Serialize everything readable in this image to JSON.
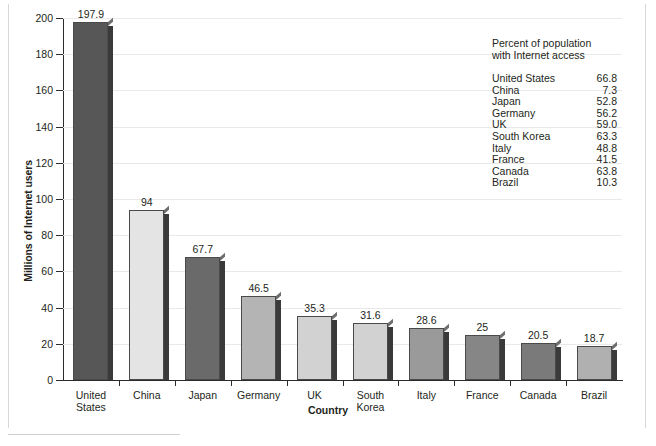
{
  "chart_data": {
    "type": "bar",
    "title": "",
    "xlabel": "Country",
    "ylabel": "Millions of Internet users",
    "ylim": [
      0,
      200
    ],
    "ytick_step": 20,
    "yticks": [
      "200",
      "180",
      "160",
      "140",
      "120",
      "100",
      "80",
      "60",
      "40",
      "20",
      "0"
    ],
    "grid": "horizontal",
    "legend_position": "top-right-inset-table",
    "categories": [
      "United States",
      "China",
      "Japan",
      "Germany",
      "UK",
      "South Korea",
      "Italy",
      "France",
      "Canada",
      "Brazil"
    ],
    "category_lines": [
      [
        "United",
        "States"
      ],
      [
        "China"
      ],
      [
        "Japan"
      ],
      [
        "Germany"
      ],
      [
        "UK"
      ],
      [
        "South",
        "Korea"
      ],
      [
        "Italy"
      ],
      [
        "France"
      ],
      [
        "Canada"
      ],
      [
        "Brazil"
      ]
    ],
    "values": [
      197.9,
      94,
      67.7,
      46.5,
      35.3,
      31.6,
      28.6,
      25,
      20.5,
      18.7
    ],
    "value_labels": [
      "197.9",
      "94",
      "67.7",
      "46.5",
      "35.3",
      "31.6",
      "28.6",
      "25",
      "20.5",
      "18.7"
    ],
    "bar_colors": [
      "#575757",
      "#e4e4e4",
      "#6a6a6a",
      "#b4b4b4",
      "#d2d2d2",
      "#d2d2d2",
      "#9a9a9a",
      "#868686",
      "#7a7a7a",
      "#b0b0b0"
    ],
    "annotation": {
      "title_line1": "Percent of population",
      "title_line2": "with Internet access",
      "rows": [
        {
          "name": "United States",
          "value": "66.8"
        },
        {
          "name": "China",
          "value": "7.3"
        },
        {
          "name": "Japan",
          "value": "52.8"
        },
        {
          "name": "Germany",
          "value": "56.2"
        },
        {
          "name": "UK",
          "value": "59.0"
        },
        {
          "name": "South Korea",
          "value": "63.3"
        },
        {
          "name": "Italy",
          "value": "48.8"
        },
        {
          "name": "France",
          "value": "41.5"
        },
        {
          "name": "Canada",
          "value": "63.8"
        },
        {
          "name": "Brazil",
          "value": "10.3"
        }
      ]
    }
  },
  "colors": {
    "axis": "#2b2b2b",
    "grid": "#e9e9e9",
    "text": "#231f20",
    "bar_edge": "#3a3a3a"
  },
  "caption": ""
}
